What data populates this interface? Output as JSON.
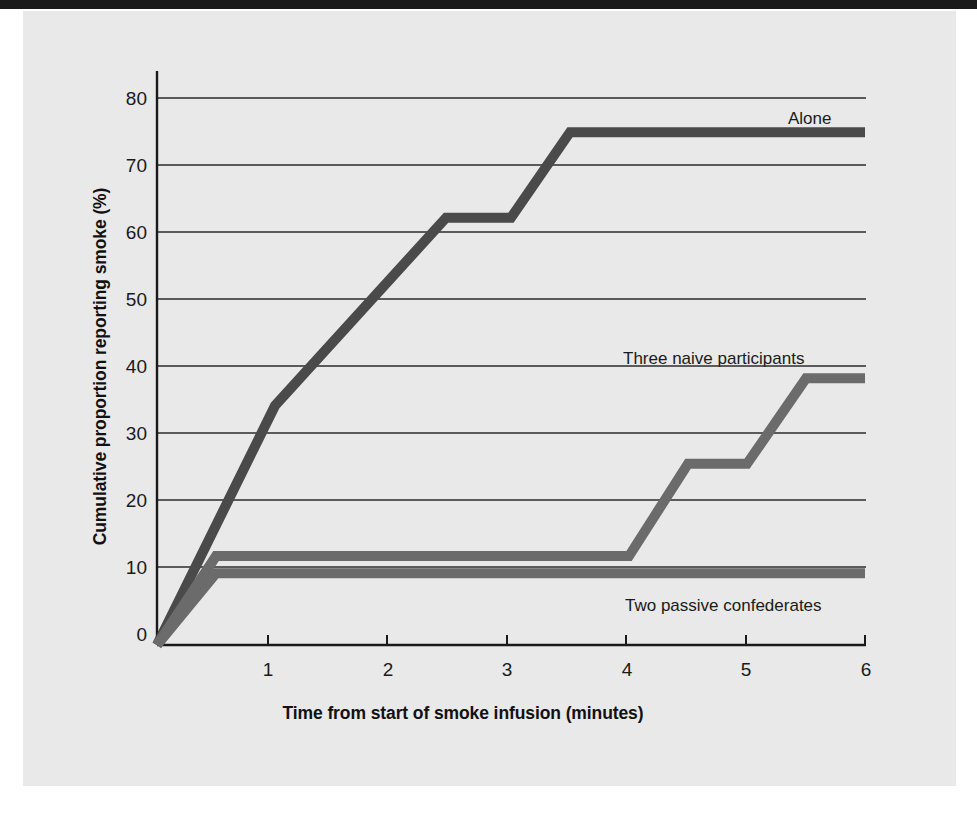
{
  "figure": {
    "background_color": "#e9e9e9",
    "page_background": "#ffffff",
    "top_rule_color": "#1a1a1a"
  },
  "chart_data": {
    "type": "line",
    "title": "",
    "subtitle": "",
    "xlabel": "Time from start of smoke infusion (minutes)",
    "ylabel": "Cumulative proportion reporting smoke (%)",
    "xlim": [
      0,
      6
    ],
    "ylim": [
      0,
      80
    ],
    "xticks": [
      1,
      2,
      3,
      4,
      5,
      6
    ],
    "xtick_labels": [
      "1",
      "2",
      "3",
      "4",
      "5",
      "6"
    ],
    "yticks": [
      0,
      10,
      20,
      30,
      40,
      50,
      60,
      70,
      80
    ],
    "ytick_labels": [
      "0",
      "10",
      "20",
      "30",
      "40",
      "50",
      "60",
      "70",
      "80"
    ],
    "grid": "horizontal",
    "grid_color": "#2b2b2b",
    "legend_position": "inline-annotations",
    "series": [
      {
        "name": "Alone",
        "color": "#4a4a4a",
        "label_x": 6.0,
        "label_y": 77.0,
        "points": [
          {
            "x": 0.0,
            "y": 0.0
          },
          {
            "x": 1.0,
            "y": 35.0
          },
          {
            "x": 2.45,
            "y": 62.5
          },
          {
            "x": 3.0,
            "y": 62.5
          },
          {
            "x": 3.5,
            "y": 75.0
          },
          {
            "x": 6.0,
            "y": 75.0
          }
        ]
      },
      {
        "name": "Three naive participants",
        "color": "#6b6b6b",
        "label_x": 5.3,
        "label_y": 43.5,
        "points": [
          {
            "x": 0.0,
            "y": 0.0
          },
          {
            "x": 0.5,
            "y": 13.0
          },
          {
            "x": 4.0,
            "y": 13.0
          },
          {
            "x": 4.5,
            "y": 26.5
          },
          {
            "x": 5.0,
            "y": 26.5
          },
          {
            "x": 5.5,
            "y": 39.0
          },
          {
            "x": 6.0,
            "y": 39.0
          }
        ]
      },
      {
        "name": "Two passive confederates",
        "color": "#6b6b6b",
        "label_x": 5.2,
        "label_y": 7.0,
        "points": [
          {
            "x": 0.0,
            "y": 0.0
          },
          {
            "x": 0.5,
            "y": 10.5
          },
          {
            "x": 6.0,
            "y": 10.5
          }
        ]
      }
    ],
    "annotations": [
      {
        "text": "Alone",
        "x": 6.0,
        "y": 77.0
      },
      {
        "text": "Three naive participants",
        "x": 5.3,
        "y": 43.5
      },
      {
        "text": "Two passive confederates",
        "x": 5.2,
        "y": 7.0
      }
    ]
  }
}
